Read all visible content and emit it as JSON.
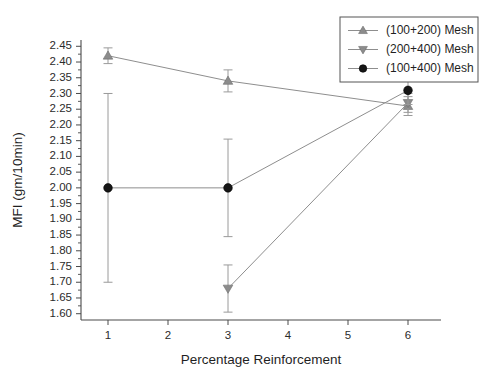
{
  "chart_data": {
    "type": "line",
    "title": "",
    "xlabel": "Percentage Reinforcement",
    "ylabel": "MFI (gm/10min)",
    "xlim": [
      0.55,
      6.55
    ],
    "ylim": [
      1.58,
      2.47
    ],
    "xticks": [
      1,
      2,
      3,
      4,
      5,
      6
    ],
    "xticklabels": [
      "1",
      "2",
      "3",
      "4",
      "5",
      "6"
    ],
    "yticks": [
      1.6,
      1.65,
      1.7,
      1.75,
      1.8,
      1.85,
      1.9,
      1.95,
      2.0,
      2.05,
      2.1,
      2.15,
      2.2,
      2.25,
      2.3,
      2.35,
      2.4,
      2.45
    ],
    "yticklabels": [
      "1.60",
      "1.65",
      "1.70",
      "1.75",
      "1.80",
      "1.85",
      "1.90",
      "1.95",
      "2.00",
      "2.05",
      "2.10",
      "2.15",
      "2.20",
      "2.25",
      "2.30",
      "2.35",
      "2.40",
      "2.45"
    ],
    "grid": false,
    "legend_position": "top-right",
    "x": [
      1,
      3,
      6
    ],
    "series": [
      {
        "name": "(100+200) Mesh",
        "marker": "triangle-up",
        "color": "#8c8c8c",
        "x": [
          1,
          3,
          6
        ],
        "values": [
          2.42,
          2.34,
          2.26
        ],
        "yerr": [
          0.025,
          0.035,
          0.03
        ]
      },
      {
        "name": "(200+400) Mesh",
        "marker": "triangle-down",
        "color": "#8c8c8c",
        "x": [
          3,
          6
        ],
        "values": [
          1.68,
          2.27
        ],
        "yerr": [
          0.075,
          0.03
        ]
      },
      {
        "name": "(100+400) Mesh",
        "marker": "circle",
        "color": "#161616",
        "x": [
          1,
          3,
          6
        ],
        "values": [
          2.0,
          2.0,
          2.31
        ],
        "yerr": [
          0.3,
          0.155,
          0.045
        ]
      }
    ]
  },
  "legend": {
    "entries": [
      {
        "label": "(100+200) Mesh"
      },
      {
        "label": "(200+400) Mesh"
      },
      {
        "label": "(100+400) Mesh"
      }
    ]
  }
}
